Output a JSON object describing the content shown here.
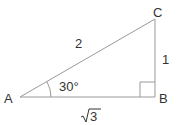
{
  "diagram": {
    "type": "right-triangle",
    "vertices": {
      "A": {
        "label": "A"
      },
      "B": {
        "label": "B"
      },
      "C": {
        "label": "C"
      }
    },
    "sides": {
      "hypotenuse_AC": "2",
      "opposite_BC": "1",
      "adjacent_AB": "3"
    },
    "angle_A": "30°",
    "right_angle_at": "B",
    "colors": {
      "line": "#999999",
      "text": "#333333"
    }
  }
}
